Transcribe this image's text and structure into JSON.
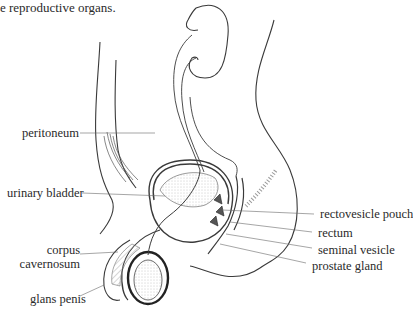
{
  "caption": "e reproductive organs.",
  "labels": {
    "peritoneum": "peritoneum",
    "urinary_bladder": "urinary bladder",
    "corpus_line1": "corpus",
    "corpus_line2": "cavernosum",
    "glans_penis": "glans penis",
    "rectovesicle_pouch": "rectovesicle pouch",
    "rectum": "rectum",
    "seminal_vesicle": "seminal vesicle",
    "prostate_gland": "prostate gland"
  },
  "colors": {
    "line": "#3a3a3a",
    "leader": "#6a6a6a",
    "stipple": "#9a9a9a"
  }
}
